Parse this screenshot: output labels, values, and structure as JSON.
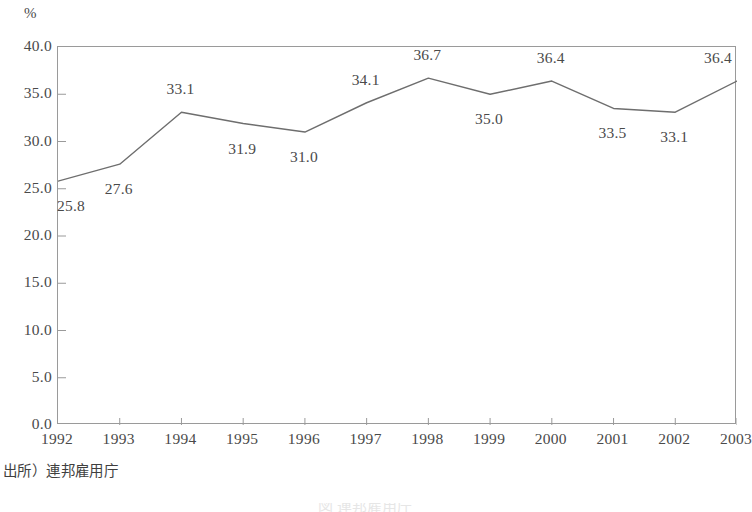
{
  "chart_data": {
    "type": "line",
    "title": "",
    "subtitle": "",
    "xlabel": "",
    "ylabel": "",
    "unit_label": "%",
    "categories": [
      "1992",
      "1993",
      "1994",
      "1995",
      "1996",
      "1997",
      "1998",
      "1999",
      "2000",
      "2001",
      "2002",
      "2003"
    ],
    "values": [
      25.8,
      27.6,
      33.1,
      31.9,
      31.0,
      34.1,
      36.7,
      35.0,
      36.4,
      33.5,
      33.1,
      36.4
    ],
    "point_labels": [
      "25.8",
      "27.6",
      "33.1",
      "31.9",
      "31.0",
      "34.1",
      "36.7",
      "35.0",
      "36.4",
      "33.5",
      "33.1",
      "36.4"
    ],
    "label_positions": [
      "below",
      "below",
      "above",
      "below",
      "below",
      "above",
      "above",
      "below",
      "above",
      "below",
      "below",
      "above"
    ],
    "ylim": [
      0.0,
      40.0
    ],
    "ytick_step": 5.0,
    "ytick_labels": [
      "40.0",
      "35.0",
      "30.0",
      "25.0",
      "20.0",
      "15.0",
      "10.0",
      "5.0",
      "0.0"
    ],
    "ytick_values": [
      40.0,
      35.0,
      30.0,
      25.0,
      20.0,
      15.0,
      10.0,
      5.0,
      0.0
    ],
    "grid": false,
    "legend": false,
    "legend_position": "none",
    "line_color": "#6e6e6e",
    "axis_color": "#9a9a9a",
    "text_color": "#4a4a4a",
    "background_color": "#ffffff"
  },
  "source": {
    "note": "出所）連邦雇用庁"
  },
  "caption": {
    "sliver_text": "図  連邦雇用庁"
  }
}
